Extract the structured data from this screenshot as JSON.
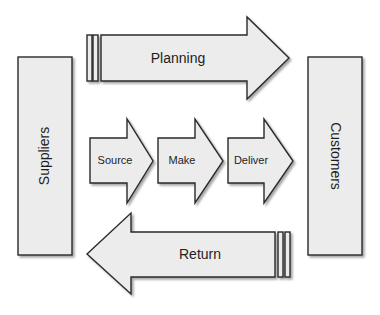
{
  "diagram": {
    "type": "supply-chain-process-diagram",
    "colors": {
      "fill": "#ececec",
      "stroke": "#2a2a2a",
      "text": "#1e1e1e",
      "background": "#ffffff"
    },
    "suppliers": {
      "label": "Suppliers"
    },
    "customers": {
      "label": "Customers"
    },
    "planning": {
      "label": "Planning",
      "direction": "right"
    },
    "return": {
      "label": "Return",
      "direction": "left"
    },
    "processes": [
      {
        "label": "Source"
      },
      {
        "label": "Make"
      },
      {
        "label": "Deliver"
      }
    ]
  }
}
